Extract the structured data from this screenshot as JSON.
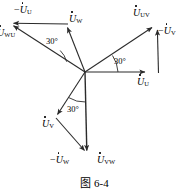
{
  "figure": {
    "type": "phasor-diagram",
    "caption": "图 6-4",
    "origin": {
      "x": 85,
      "y": 72
    },
    "angle_marks": [
      {
        "id": "angle-upper-left",
        "text": "30°",
        "x": 47,
        "y": 40
      },
      {
        "id": "angle-right",
        "text": "30°",
        "x": 116,
        "y": 61
      },
      {
        "id": "angle-lower",
        "text": "30°",
        "x": 68,
        "y": 108
      }
    ],
    "labels": [
      {
        "id": "label-neg-u-u",
        "prefix": "−",
        "symbol": "U",
        "sub": "U",
        "x": 17,
        "y": 6
      },
      {
        "id": "label-u-wu",
        "prefix": "",
        "symbol": "U",
        "sub": "WU",
        "x": -3,
        "y": 28
      },
      {
        "id": "label-u-w",
        "prefix": "",
        "symbol": "U",
        "sub": "W",
        "x": 70,
        "y": 15
      },
      {
        "id": "label-u-uv",
        "prefix": "",
        "symbol": "U",
        "sub": "UV",
        "x": 135,
        "y": 9
      },
      {
        "id": "label-neg-u-v",
        "prefix": "−",
        "symbol": "U",
        "sub": "V",
        "x": 161,
        "y": 26
      },
      {
        "id": "label-u-u",
        "prefix": "",
        "symbol": "U",
        "sub": "U",
        "x": 139,
        "y": 78
      },
      {
        "id": "label-u-v",
        "prefix": "",
        "symbol": "U",
        "sub": "V",
        "x": 44,
        "y": 120
      },
      {
        "id": "label-neg-u-w",
        "prefix": "−",
        "symbol": "U",
        "sub": "W",
        "x": 52,
        "y": 156
      },
      {
        "id": "label-u-vw",
        "prefix": "",
        "symbol": "U",
        "sub": "VW",
        "x": 99,
        "y": 156
      }
    ],
    "vectors": [
      {
        "id": "vector-u-u",
        "name": "U_U",
        "x1": 85,
        "y1": 72,
        "x2": 148,
        "y2": 72,
        "arrow": true
      },
      {
        "id": "vector-u-w",
        "name": "U_W",
        "x1": 85,
        "y1": 72,
        "x2": 66,
        "y2": 24,
        "arrow": true
      },
      {
        "id": "vector-u-v",
        "name": "U_V",
        "x1": 85,
        "y1": 72,
        "x2": 55,
        "y2": 118,
        "arrow": true
      },
      {
        "id": "vector-u-uv",
        "name": "U_UV",
        "x1": 85,
        "y1": 72,
        "x2": 156,
        "y2": 25,
        "arrow": true
      },
      {
        "id": "vector-u-wu",
        "name": "U_WU",
        "x1": 85,
        "y1": 72,
        "x2": 9,
        "y2": 23,
        "arrow": true
      },
      {
        "id": "vector-u-vw",
        "name": "U_VW",
        "x1": 85,
        "y1": 72,
        "x2": 87,
        "y2": 154,
        "arrow": true
      },
      {
        "id": "vector-neg-u-u",
        "name": "-U_U",
        "x1": 68,
        "y1": 24,
        "x2": 9,
        "y2": 23,
        "arrow": true
      },
      {
        "id": "vector-neg-u-v",
        "name": "-U_V",
        "x1": 158,
        "y1": 73,
        "x2": 157,
        "y2": 26,
        "arrow": true
      },
      {
        "id": "vector-neg-u-w",
        "name": "-U_W",
        "x1": 56,
        "y1": 118,
        "x2": 87,
        "y2": 154,
        "arrow": true
      }
    ],
    "colors": {
      "stroke": "#2b2b2b",
      "text": "#000000",
      "background": "#ffffff"
    }
  }
}
